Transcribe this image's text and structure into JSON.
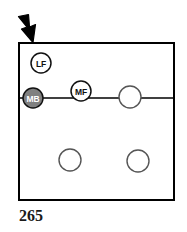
{
  "figure": {
    "caption": "265",
    "panel": {
      "border_color": "#000000",
      "background": "#ffffff",
      "x": 19,
      "y": 43,
      "width": 155,
      "height": 157
    },
    "pointer": {
      "name": "down-right-arrow",
      "color": "#000000",
      "tip_x": 33,
      "tip_y": 43,
      "direction": "down-right"
    },
    "horizontal_line": {
      "y": 98,
      "x_start": 19,
      "x_end": 174,
      "color": "#000000"
    },
    "nodes": [
      {
        "label": "LF",
        "cx": 41,
        "cy": 63,
        "r": 10,
        "fill": "#ffffff",
        "stroke": "#111111",
        "label_color": "#111111",
        "filled": false
      },
      {
        "label": "MB",
        "cx": 33,
        "cy": 98,
        "r": 10,
        "fill": "#808080",
        "stroke": "#111111",
        "label_color": "#ffffff",
        "filled": true
      },
      {
        "label": "MF",
        "cx": 81,
        "cy": 91,
        "r": 10,
        "fill": "#ffffff",
        "stroke": "#111111",
        "label_color": "#111111",
        "filled": false
      },
      {
        "label": "",
        "cx": 130,
        "cy": 97,
        "r": 11,
        "fill": "#ffffff",
        "stroke": "#555555",
        "label_color": "#111111",
        "filled": false
      },
      {
        "label": "",
        "cx": 70,
        "cy": 160,
        "r": 11,
        "fill": "#ffffff",
        "stroke": "#555555",
        "label_color": "#111111",
        "filled": false
      },
      {
        "label": "",
        "cx": 138,
        "cy": 161,
        "r": 11,
        "fill": "#ffffff",
        "stroke": "#555555",
        "label_color": "#111111",
        "filled": false
      }
    ]
  }
}
